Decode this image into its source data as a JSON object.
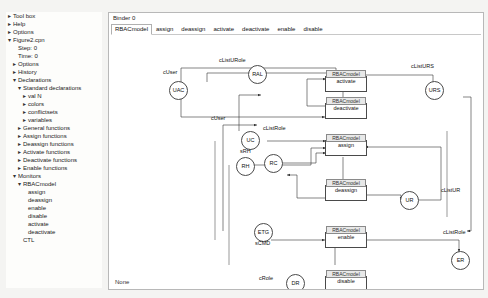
{
  "sidebar": {
    "items": [
      {
        "twisty": "▸",
        "label": "Tool box",
        "indent": 0
      },
      {
        "twisty": "▸",
        "label": "Help",
        "indent": 0
      },
      {
        "twisty": "▸",
        "label": "Options",
        "indent": 0
      },
      {
        "twisty": "▾",
        "label": "Figure2.cpn",
        "indent": 0
      },
      {
        "twisty": "",
        "label": "Step: 0",
        "indent": 1
      },
      {
        "twisty": "",
        "label": "Time: 0",
        "indent": 1
      },
      {
        "twisty": "▸",
        "label": "Options",
        "indent": 1
      },
      {
        "twisty": "▸",
        "label": "History",
        "indent": 1
      },
      {
        "twisty": "▾",
        "label": "Declarations",
        "indent": 1
      },
      {
        "twisty": "▾",
        "label": "Standard declarations",
        "indent": 2
      },
      {
        "twisty": "▸",
        "label": "val N",
        "indent": 3
      },
      {
        "twisty": "▸",
        "label": "colors",
        "indent": 3
      },
      {
        "twisty": "▸",
        "label": "conflictsets",
        "indent": 3
      },
      {
        "twisty": "▸",
        "label": "variables",
        "indent": 3
      },
      {
        "twisty": "▸",
        "label": "General functions",
        "indent": 2
      },
      {
        "twisty": "▸",
        "label": "Assign functions",
        "indent": 2
      },
      {
        "twisty": "▸",
        "label": "Deassign functions",
        "indent": 2
      },
      {
        "twisty": "▸",
        "label": "Activate functions",
        "indent": 2
      },
      {
        "twisty": "▸",
        "label": "Deactivate functions",
        "indent": 2
      },
      {
        "twisty": "▸",
        "label": "Enable functions",
        "indent": 2
      },
      {
        "twisty": "▾",
        "label": "Monitors",
        "indent": 1
      },
      {
        "twisty": "▾",
        "label": "RBACmodel",
        "indent": 2
      },
      {
        "twisty": "",
        "label": "assign",
        "indent": 3
      },
      {
        "twisty": "",
        "label": "deassign",
        "indent": 3
      },
      {
        "twisty": "",
        "label": "enable",
        "indent": 3
      },
      {
        "twisty": "",
        "label": "disable",
        "indent": 3
      },
      {
        "twisty": "",
        "label": "activate",
        "indent": 3
      },
      {
        "twisty": "",
        "label": "deactivate",
        "indent": 3
      },
      {
        "twisty": "",
        "label": "CTL",
        "indent": 2
      }
    ]
  },
  "binder": {
    "title": "Binder 0"
  },
  "tabs": [
    {
      "label": "RBACmodel",
      "active": true
    },
    {
      "label": "assign",
      "active": false
    },
    {
      "label": "deassign",
      "active": false
    },
    {
      "label": "activate",
      "active": false
    },
    {
      "label": "deactivate",
      "active": false
    },
    {
      "label": "enable",
      "active": false
    },
    {
      "label": "disable",
      "active": false
    }
  ],
  "net": {
    "transitions": [
      {
        "id": "activate",
        "label": "activate",
        "top_label": "RBACmodel"
      },
      {
        "id": "deactivate",
        "label": "deactivate",
        "top_label": "RBACmodel"
      },
      {
        "id": "assign",
        "label": "assign",
        "top_label": "RBACmodel"
      },
      {
        "id": "deassign",
        "label": "deassign",
        "top_label": "RBACmodel"
      },
      {
        "id": "enable",
        "label": "enable",
        "top_label": "RBACmodel"
      },
      {
        "id": "disable",
        "label": "disable",
        "top_label": "RBACmodel"
      }
    ],
    "places": [
      {
        "id": "uac",
        "label": "UAC"
      },
      {
        "id": "ral",
        "label": "RAL"
      },
      {
        "id": "urs",
        "label": "URS"
      },
      {
        "id": "uc",
        "label": "UC"
      },
      {
        "id": "rh",
        "label": "RH"
      },
      {
        "id": "rc",
        "label": "RC"
      },
      {
        "id": "ur",
        "label": "UR"
      },
      {
        "id": "etg",
        "label": "ETG"
      },
      {
        "id": "er",
        "label": "ER"
      },
      {
        "id": "dr",
        "label": "DR"
      }
    ],
    "arc_labels": [
      {
        "id": "a1",
        "text": "cListURole"
      },
      {
        "id": "a2",
        "text": "cListURS"
      },
      {
        "id": "a3",
        "text": "cUser"
      },
      {
        "id": "a4",
        "text": "cUser"
      },
      {
        "id": "a5",
        "text": "cListRole"
      },
      {
        "id": "a6",
        "text": "sRH"
      },
      {
        "id": "a7",
        "text": "cListUR"
      },
      {
        "id": "a8",
        "text": "cListRole"
      },
      {
        "id": "a9",
        "text": "sCMD"
      },
      {
        "id": "a10",
        "text": "cRole"
      }
    ],
    "status": "None"
  }
}
